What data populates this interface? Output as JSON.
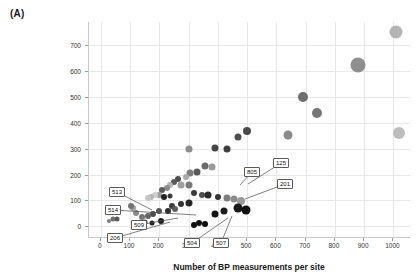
{
  "panel": {
    "label": "(A)"
  },
  "axes": {
    "xlabel": "Number of BP measurements per site",
    "ylabel": "Number of unique BP measurements",
    "xticks": [
      "0",
      "100",
      "200",
      "300",
      "400",
      "500",
      "600",
      "700",
      "800",
      "900",
      "1000"
    ],
    "yticks": [
      "0",
      "100",
      "200",
      "300",
      "400",
      "500",
      "600",
      "700"
    ]
  },
  "chart_data": {
    "type": "scatter",
    "title": "",
    "subtitle": "",
    "xlabel": "Number of BP measurements per site",
    "ylabel": "Number of unique BP measurements",
    "xlim": [
      -40,
      1060
    ],
    "ylim": [
      -45,
      790
    ],
    "xticks": [
      0,
      100,
      200,
      300,
      400,
      500,
      600,
      700,
      800,
      900,
      1000
    ],
    "yticks": [
      0,
      100,
      200,
      300,
      400,
      500,
      600,
      700
    ],
    "grid": true,
    "legend": null,
    "marker": "circle",
    "note": "Bubble size and gray shade vary per point; size encodes an unlabeled third variable.",
    "points": [
      {
        "x": 1010,
        "y": 752,
        "size": 13,
        "color": "#b4b4b4"
      },
      {
        "x": 880,
        "y": 625,
        "size": 15,
        "color": "#8f8f8f"
      },
      {
        "x": 1020,
        "y": 360,
        "size": 12,
        "color": "#bdbdbd"
      },
      {
        "x": 690,
        "y": 500,
        "size": 10,
        "color": "#6e6e6e"
      },
      {
        "x": 740,
        "y": 440,
        "size": 10,
        "color": "#777777"
      },
      {
        "x": 640,
        "y": 355,
        "size": 9,
        "color": "#8a8a8a"
      },
      {
        "x": 500,
        "y": 368,
        "size": 8,
        "color": "#4a4a4a"
      },
      {
        "x": 470,
        "y": 345,
        "size": 7,
        "color": "#4f4f4f"
      },
      {
        "x": 430,
        "y": 300,
        "size": 7,
        "color": "#3f3f3f"
      },
      {
        "x": 390,
        "y": 302,
        "size": 7,
        "color": "#454545"
      },
      {
        "x": 300,
        "y": 300,
        "size": 7,
        "color": "#8c8c8c"
      },
      {
        "x": 355,
        "y": 232,
        "size": 7,
        "color": "#6a6a6a"
      },
      {
        "x": 380,
        "y": 228,
        "size": 7,
        "color": "#9a9a9a"
      },
      {
        "x": 330,
        "y": 212,
        "size": 7,
        "color": "#5a5a5a"
      },
      {
        "x": 305,
        "y": 205,
        "size": 7,
        "color": "#7d7d7d"
      },
      {
        "x": 290,
        "y": 190,
        "size": 6,
        "color": "#aaaaaa"
      },
      {
        "x": 265,
        "y": 182,
        "size": 6,
        "color": "#4b4b4b"
      },
      {
        "x": 275,
        "y": 160,
        "size": 7,
        "color": "#9e9e9e"
      },
      {
        "x": 300,
        "y": 158,
        "size": 7,
        "color": "#7a7a7a"
      },
      {
        "x": 250,
        "y": 172,
        "size": 6,
        "color": "#585858"
      },
      {
        "x": 236,
        "y": 158,
        "size": 6,
        "color": "#b2b2b2"
      },
      {
        "x": 225,
        "y": 148,
        "size": 6,
        "color": "#8d8d8d"
      },
      {
        "x": 210,
        "y": 140,
        "size": 6,
        "color": "#5d5d5d"
      },
      {
        "x": 200,
        "y": 123,
        "size": 6,
        "color": "#9c9c9c"
      },
      {
        "x": 186,
        "y": 120,
        "size": 6,
        "color": "#cfcfcf"
      },
      {
        "x": 172,
        "y": 115,
        "size": 6,
        "color": "#b8b8b8"
      },
      {
        "x": 160,
        "y": 110,
        "size": 6,
        "color": "#c6c6c6"
      },
      {
        "x": 215,
        "y": 112,
        "size": 6,
        "color": "#222222"
      },
      {
        "x": 235,
        "y": 118,
        "size": 5,
        "color": "#3a3a3a"
      },
      {
        "x": 320,
        "y": 128,
        "size": 6,
        "color": "#3c3c3c"
      },
      {
        "x": 345,
        "y": 122,
        "size": 6,
        "color": "#4e4e4e"
      },
      {
        "x": 365,
        "y": 120,
        "size": 7,
        "color": "#2b2b2b"
      },
      {
        "x": 400,
        "y": 112,
        "size": 6,
        "color": "#333333"
      },
      {
        "x": 430,
        "y": 108,
        "size": 7,
        "color": "#7e7e7e"
      },
      {
        "x": 455,
        "y": 104,
        "size": 7,
        "color": "#8b8b8b"
      },
      {
        "x": 480,
        "y": 98,
        "size": 8,
        "color": "#9a9a9a"
      },
      {
        "x": 470,
        "y": 72,
        "size": 9,
        "color": "#191919"
      },
      {
        "x": 495,
        "y": 62,
        "size": 9,
        "color": "#111111"
      },
      {
        "x": 420,
        "y": 58,
        "size": 7,
        "color": "#1c1c1c"
      },
      {
        "x": 390,
        "y": 48,
        "size": 7,
        "color": "#151515"
      },
      {
        "x": 300,
        "y": 92,
        "size": 7,
        "color": "#262626"
      },
      {
        "x": 275,
        "y": 85,
        "size": 6,
        "color": "#343434"
      },
      {
        "x": 245,
        "y": 80,
        "size": 6,
        "color": "#3d3d3d"
      },
      {
        "x": 255,
        "y": 66,
        "size": 6,
        "color": "#5e5e5e"
      },
      {
        "x": 230,
        "y": 58,
        "size": 6,
        "color": "#2f2f2f"
      },
      {
        "x": 200,
        "y": 60,
        "size": 6,
        "color": "#565656"
      },
      {
        "x": 180,
        "y": 48,
        "size": 6,
        "color": "#4c4c4c"
      },
      {
        "x": 160,
        "y": 40,
        "size": 6,
        "color": "#646464"
      },
      {
        "x": 140,
        "y": 36,
        "size": 6,
        "color": "#747474"
      },
      {
        "x": 120,
        "y": 52,
        "size": 6,
        "color": "#8a8a8a"
      },
      {
        "x": 110,
        "y": 72,
        "size": 6,
        "color": "#9f9f9f"
      },
      {
        "x": 105,
        "y": 80,
        "size": 6,
        "color": "#747474"
      },
      {
        "x": 55,
        "y": 30,
        "size": 5,
        "color": "#5a5a5a"
      },
      {
        "x": 42,
        "y": 28,
        "size": 5,
        "color": "#6f6f6f"
      },
      {
        "x": 30,
        "y": 22,
        "size": 4,
        "color": "#7c7c7c"
      },
      {
        "x": 150,
        "y": 18,
        "size": 5,
        "color": "#2c2c2c"
      },
      {
        "x": 175,
        "y": 14,
        "size": 5,
        "color": "#242424"
      },
      {
        "x": 205,
        "y": 22,
        "size": 6,
        "color": "#1f1f1f"
      },
      {
        "x": 335,
        "y": 14,
        "size": 6,
        "color": "#131313"
      },
      {
        "x": 355,
        "y": 8,
        "size": 6,
        "color": "#0d0d0d"
      },
      {
        "x": 318,
        "y": 5,
        "size": 6,
        "color": "#101010"
      }
    ],
    "annotations": [
      {
        "label": "513",
        "box_x": 117,
        "box_y": 192,
        "target_x": 152,
        "target_y": 210
      },
      {
        "label": "514",
        "box_x": 113,
        "box_y": 210,
        "target_x": 196,
        "target_y": 215
      },
      {
        "label": "509",
        "box_x": 139,
        "box_y": 225,
        "target_x": 178,
        "target_y": 218
      },
      {
        "label": "206",
        "box_x": 115,
        "box_y": 238,
        "target_x": 170,
        "target_y": 222
      },
      {
        "label": "504",
        "box_x": 192,
        "box_y": 243,
        "target_x": 228,
        "target_y": 218
      },
      {
        "label": "507",
        "box_x": 221,
        "box_y": 243,
        "target_x": 232,
        "target_y": 216
      },
      {
        "label": "805",
        "box_x": 252,
        "box_y": 172,
        "target_x": 240,
        "target_y": 185
      },
      {
        "label": "125",
        "box_x": 281,
        "box_y": 163,
        "target_x": 248,
        "target_y": 184
      },
      {
        "label": "201",
        "box_x": 285,
        "box_y": 184,
        "target_x": 245,
        "target_y": 199
      }
    ]
  }
}
